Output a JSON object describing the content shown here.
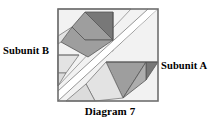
{
  "figure": {
    "caption": "Diagram 7",
    "labels": {
      "left": "Subunit B",
      "right": "Subunit A"
    }
  },
  "colors": {
    "outline": "#555555",
    "background": "#ffffff",
    "very_light_gray": "#f2f2f2",
    "light_gray": "#e3e3e3",
    "pale_gray": "#dcdcdc",
    "medium_gray": "#9e9e9e",
    "mid_gray": "#adadad",
    "dark_gray": "#787878",
    "text": "#000000"
  },
  "geometry": {
    "square": {
      "x": 58,
      "y": 9,
      "width": 100,
      "height": 92
    },
    "divider_band": {
      "description": "white diagonal band from lower-left to upper-right"
    },
    "subunit_b_pieces": [
      {
        "name": "piece-b-background",
        "tone": "very_light_gray"
      },
      {
        "name": "piece-b-dark-triangle",
        "tone": "dark_gray"
      },
      {
        "name": "piece-b-medium-quad",
        "tone": "medium_gray"
      },
      {
        "name": "piece-b-light-wedge",
        "tone": "light_gray"
      },
      {
        "name": "piece-b-lower-strip",
        "tone": "pale_gray"
      }
    ],
    "subunit_a_pieces": [
      {
        "name": "piece-a-background",
        "tone": "very_light_gray"
      },
      {
        "name": "piece-a-medium-triangle",
        "tone": "mid_gray"
      },
      {
        "name": "piece-a-dark-triangle",
        "tone": "dark_gray"
      },
      {
        "name": "piece-a-light-quad",
        "tone": "light_gray"
      }
    ]
  }
}
